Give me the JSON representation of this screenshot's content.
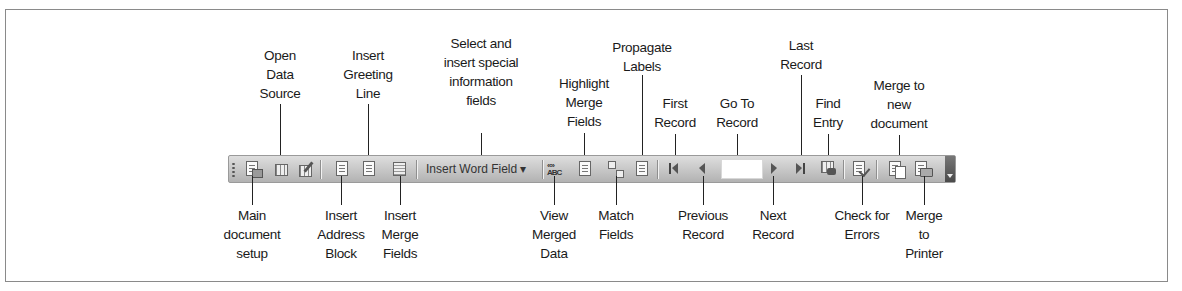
{
  "toolbar": {
    "name": "Mail Merge toolbar",
    "insert_word_field_label": "Insert Word Field ▾",
    "go_to_record_value": "",
    "buttons": [
      {
        "id": "main-document-setup",
        "icon": "main-document-setup-icon"
      },
      {
        "id": "open-data-source",
        "icon": "open-data-source-icon"
      },
      {
        "id": "mail-merge-recipients",
        "icon": "recipients-icon"
      },
      {
        "id": "insert-address-block",
        "icon": "address-block-icon"
      },
      {
        "id": "insert-greeting-line",
        "icon": "greeting-line-icon"
      },
      {
        "id": "insert-merge-fields",
        "icon": "merge-fields-icon"
      },
      {
        "id": "insert-word-field",
        "icon": "dropdown"
      },
      {
        "id": "view-merged-data",
        "icon": "view-merged-data-icon"
      },
      {
        "id": "highlight-merge-fields",
        "icon": "highlight-icon"
      },
      {
        "id": "match-fields",
        "icon": "match-fields-icon"
      },
      {
        "id": "propagate-labels",
        "icon": "propagate-labels-icon"
      },
      {
        "id": "first-record",
        "icon": "first-record-icon"
      },
      {
        "id": "previous-record",
        "icon": "previous-record-icon"
      },
      {
        "id": "go-to-record",
        "icon": "input"
      },
      {
        "id": "next-record",
        "icon": "next-record-icon"
      },
      {
        "id": "last-record",
        "icon": "last-record-icon"
      },
      {
        "id": "find-entry",
        "icon": "find-entry-icon"
      },
      {
        "id": "check-for-errors",
        "icon": "check-errors-icon"
      },
      {
        "id": "merge-to-new-document",
        "icon": "merge-new-doc-icon"
      },
      {
        "id": "merge-to-printer",
        "icon": "merge-printer-icon"
      }
    ]
  },
  "callouts_top": [
    {
      "text": "Open\nData\nSource",
      "x": 280
    },
    {
      "text": "Insert\nGreeting\nLine",
      "x": 368
    },
    {
      "text": "Select and\ninsert special\ninformation\nfields",
      "x": 481
    },
    {
      "text": "Highlight\nMerge\nFields",
      "x": 584
    },
    {
      "text": "Propagate\nLabels",
      "x": 642
    },
    {
      "text": "First\nRecord",
      "x": 675
    },
    {
      "text": "Go To\nRecord",
      "x": 737
    },
    {
      "text": "Last\nRecord",
      "x": 801
    },
    {
      "text": "Find\nEntry",
      "x": 828
    },
    {
      "text": "Merge to\nnew\ndocument",
      "x": 899
    }
  ],
  "callouts_bottom": [
    {
      "text": "Main\ndocument\nsetup",
      "x": 252
    },
    {
      "text": "Insert\nAddress\nBlock",
      "x": 341
    },
    {
      "text": "Insert\nMerge\nFields",
      "x": 400
    },
    {
      "text": "View\nMerged\nData",
      "x": 554
    },
    {
      "text": "Match\nFields",
      "x": 616
    },
    {
      "text": "Previous\nRecord",
      "x": 703
    },
    {
      "text": "Next\nRecord",
      "x": 773
    },
    {
      "text": "Check for\nErrors",
      "x": 862
    },
    {
      "text": "Merge\nto\nPrinter",
      "x": 924
    }
  ]
}
